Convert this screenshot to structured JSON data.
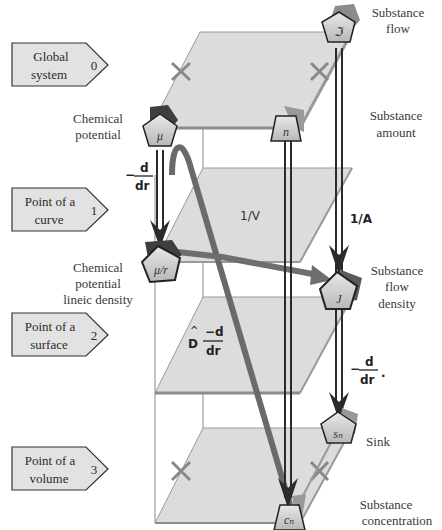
{
  "levels": [
    {
      "line1": "Global",
      "line2": "system",
      "index": "0"
    },
    {
      "line1": "Point of a",
      "line2": "curve",
      "index": "1"
    },
    {
      "line1": "Point of a",
      "line2": "surface",
      "index": "2"
    },
    {
      "line1": "Point of a",
      "line2": "volume",
      "index": "3"
    }
  ],
  "nodes": {
    "mu": {
      "symbol": "μ",
      "label_line1": "Chemical",
      "label_line2": "potential"
    },
    "mu_r": {
      "symbol": "μ/r",
      "label_line1": "Chemical",
      "label_line2": "potential",
      "label_line3": "lineic density"
    },
    "n": {
      "symbol": "n",
      "label_line1": "Substance",
      "label_line2": "amount"
    },
    "flow": {
      "symbol": "ℑ",
      "label_line1": "Substance",
      "label_line2": "flow"
    },
    "J": {
      "symbol": "J",
      "label_line1": "Substance",
      "label_line2": "flow",
      "label_line3": "density"
    },
    "sn": {
      "symbol": "sₙ",
      "label_line1": "Sink"
    },
    "cn": {
      "symbol": "cₙ",
      "label_line1": "Substance",
      "label_line2": "concentration"
    }
  },
  "operators": {
    "neg_d_dr_left": {
      "minus": "−",
      "num": "d",
      "den": "dr"
    },
    "one_over_V": "1/V",
    "one_over_A": "1/A",
    "neg_d_dr_right": {
      "minus": "−",
      "num": "d",
      "den": "dr",
      "dot": "·"
    },
    "hodge_D": {
      "hat": "^",
      "D": "D",
      "num": "−d",
      "den": "dr"
    }
  },
  "colors": {
    "plane_fill": "#d9d9d9",
    "plane_edge": "#9a9a9a",
    "arrow_dark": "#2b2b2b",
    "arrow_gray": "#6e6e6e",
    "node_fill": "#cfcfcf",
    "node_shadow": "#8c8c8c",
    "cross": "#888888"
  }
}
